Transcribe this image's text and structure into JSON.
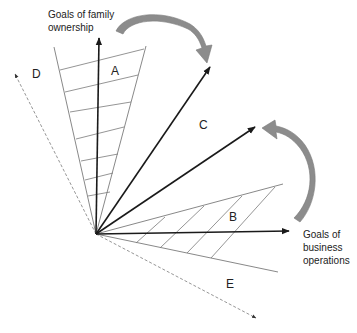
{
  "diagram": {
    "axis_labels": {
      "family": [
        "Goals of family",
        "ownership"
      ],
      "business": [
        "Goals of",
        "business",
        "operations"
      ]
    },
    "regions": {
      "A": "A",
      "B": "B",
      "C": "C",
      "D": "D",
      "E": "E"
    },
    "colors": {
      "axis": "#1a1a1a",
      "wedge_line": "#7a7a7a",
      "curved_arrow": "#8c8c8c",
      "dashed": "#8a8a8a"
    }
  }
}
